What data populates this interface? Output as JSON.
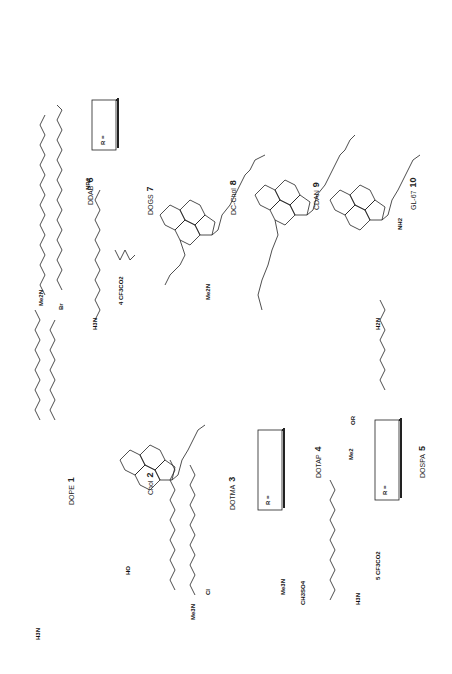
{
  "figure": {
    "orientation": "rotated-90-ccw",
    "compounds": [
      {
        "id": "1",
        "name": "DOPE",
        "label": "DOPE",
        "number": "1"
      },
      {
        "id": "2",
        "name": "Chol",
        "label": "Chol",
        "number": "2"
      },
      {
        "id": "3",
        "name": "DOTMA",
        "label": "DOTMA",
        "number": "3"
      },
      {
        "id": "4",
        "name": "DOTAP",
        "label": "DOTAP",
        "number": "4"
      },
      {
        "id": "5",
        "name": "DOSPA",
        "label": "DOSPA",
        "number": "5"
      },
      {
        "id": "6",
        "name": "DDAB",
        "label": "DDAB",
        "number": "6"
      },
      {
        "id": "7",
        "name": "DOGS",
        "label": "DOGS",
        "number": "7"
      },
      {
        "id": "8",
        "name": "DC-Chol",
        "label": "DC-Chol",
        "number": "8"
      },
      {
        "id": "9",
        "name": "CDAN",
        "label": "CDAN",
        "number": "9"
      },
      {
        "id": "10",
        "name": "GL-67",
        "label": "GL-67",
        "number": "10"
      }
    ],
    "atoms": {
      "me2n_ddab": "Me2N",
      "br": "Br",
      "h3n_dogs": "H3N",
      "nh2_dogs": "NH2",
      "tfa_dogs": "4 CF3CO2",
      "nr2": "NR2",
      "r_box_dogs": "R =",
      "r_box_dogs_sub": "17",
      "me2n_dogs": "Me2N",
      "h2n_gl67": "H2N",
      "nh2_gl67": "NH2",
      "h3n_dope": "H3N",
      "ho_chol": "HO",
      "me3n_dotma": "Me3N",
      "cl_dotma": "Cl",
      "me3n_dotap": "Me3N",
      "ch3so4": "CH3SO4",
      "r_box_dotap": "R =",
      "r_box_dotap_sub": "7",
      "h3n_dospa": "H3N",
      "tfa_dospa": "5 CF3CO2",
      "me2_dospa": "Me2",
      "or": "OR",
      "r_box_dospa": "R =",
      "r_box_dospa_sub1": "7",
      "r_box_dospa_sub2": "8"
    }
  }
}
